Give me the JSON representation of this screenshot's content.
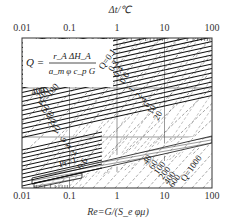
{
  "chart_data": {
    "type": "line",
    "title": "",
    "top_axis": {
      "label": "Δt/℃",
      "scale": "log",
      "range": [
        0.01,
        100
      ],
      "ticks": [
        "0.01",
        "0.1",
        "1",
        "10",
        "100"
      ]
    },
    "bottom_axis": {
      "label": "Re=G/(S_e φμ)",
      "scale": "log",
      "range": [
        0.01,
        100
      ],
      "ticks": [
        "0.01",
        "0.1",
        "1",
        "10",
        "100"
      ]
    },
    "formula": {
      "lhs": "Q =",
      "numerator": "r_A ΔH_A",
      "denominator": "a_m φ c_p G"
    },
    "grid": true,
    "pr_family": {
      "prefix": "Pr=",
      "labels": [
        "400",
        "200",
        "100",
        "60",
        "40",
        "20",
        "10",
        "6",
        "4",
        "2",
        "1",
        "0.6"
      ],
      "hatched_band_label": "Pr=1",
      "style": "solid"
    },
    "q_family": {
      "prefix": "Q=",
      "labels": [
        "0.1",
        "0.2",
        "0.4",
        "0.6",
        "1",
        "2",
        "4",
        "6",
        "10",
        "20",
        "40",
        "60",
        "100",
        "200",
        "400",
        "600",
        "1000"
      ],
      "style": "dashed"
    },
    "series": [
      {
        "name": "Pr=400",
        "family": "Pr",
        "x": [
          0.01,
          100
        ],
        "y_rel": [
          0.72,
          1.0
        ]
      },
      {
        "name": "Q=0.1",
        "family": "Q",
        "x": [
          1,
          100
        ],
        "y_rel": [
          1.0,
          1.0
        ]
      },
      {
        "name": "Q=1000",
        "family": "Q",
        "x": [
          0.01,
          100
        ],
        "y_rel": [
          0.0,
          0.0
        ]
      }
    ]
  }
}
